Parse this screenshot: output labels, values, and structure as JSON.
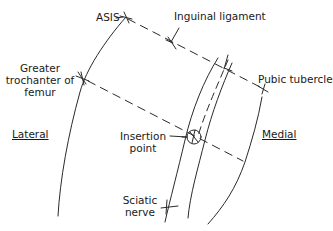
{
  "labels": {
    "asis": "ASIS",
    "inguinal_ligament": "Inguinal ligament",
    "greater_trochanter_line1": "Greater",
    "greater_trochanter_line2": "trochanter of",
    "greater_trochanter_line3": "femur",
    "pubic_tubercle": "Pubic tubercle",
    "lateral": "Lateral",
    "medial": "Medial",
    "insertion_point_line1": "Insertion",
    "insertion_point_line2": "point",
    "sciatic_nerve_line1": "Sciatic",
    "sciatic_nerve_line2": "nerve"
  },
  "colors": {
    "line": "#2a2a2a",
    "text": "#1a1a1a",
    "background": "#ffffff"
  },
  "landmarks": {
    "asis": [
      126,
      17
    ],
    "greater_trochanter": [
      82,
      78
    ],
    "pubic_tubercle": [
      264,
      89
    ],
    "insertion_point": [
      194,
      137
    ]
  }
}
